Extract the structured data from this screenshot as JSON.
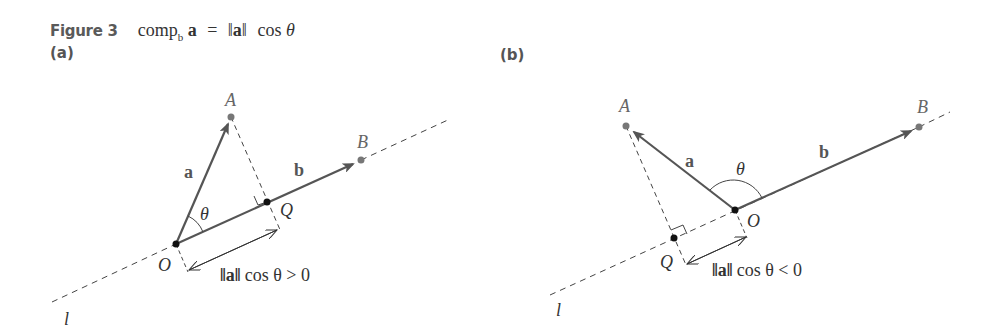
{
  "figure": {
    "label": "Figure 3",
    "caption": {
      "lhs_comp": "comp",
      "lhs_sub": "b",
      "lhs_vec": "a",
      "equals": "=",
      "norm_open": "‖",
      "norm_vec": "a",
      "norm_close": "‖",
      "func": "cos",
      "angle": "θ"
    }
  },
  "panels": [
    {
      "label": "(a)",
      "points": {
        "A": "A",
        "B": "B",
        "O": "O",
        "Q": "Q"
      },
      "vectors": {
        "a": "a",
        "b": "b"
      },
      "angle_label": "θ",
      "line_label": "l",
      "measure": {
        "norm": "‖a‖",
        "rest": "cos θ > 0"
      }
    },
    {
      "label": "(b)",
      "points": {
        "A": "A",
        "B": "B",
        "O": "O",
        "Q": "Q"
      },
      "vectors": {
        "a": "a",
        "b": "b"
      },
      "angle_label": "θ",
      "line_label": "l",
      "measure": {
        "norm": "‖a‖",
        "rest": "cos θ < 0"
      }
    }
  ],
  "colors": {
    "vector": "#555555",
    "point": "#666666",
    "origin": "#111111",
    "dash": "#444444"
  }
}
